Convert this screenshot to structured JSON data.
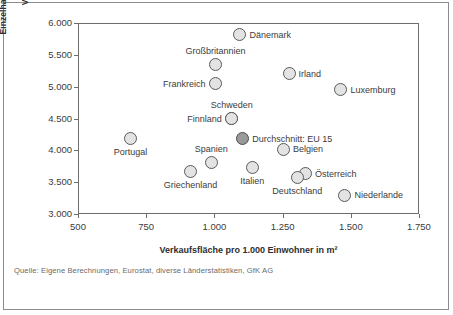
{
  "source_note": "Quelle: Eigene Berechnungen, Eurostat, diverse Länderstatistiken, GfK AG",
  "chart_data": {
    "type": "scatter",
    "title": "",
    "xlabel": "Verkaufsfläche pro 1.000 Einwohner in m²",
    "ylabel_line1": "Einzelhandelsumsatz in Euro pro m²",
    "ylabel_line2": "Verkaufsfläche",
    "xlim": [
      500,
      1750
    ],
    "ylim": [
      3000,
      6000
    ],
    "xticks": [
      "500",
      "750",
      "1.000",
      "1.250",
      "1.500",
      "1.750"
    ],
    "xtick_values": [
      500,
      750,
      1000,
      1250,
      1500,
      1750
    ],
    "yticks": [
      "3.000",
      "3.500",
      "4.000",
      "4.500",
      "5.000",
      "5.500",
      "6.000"
    ],
    "ytick_values": [
      3000,
      3500,
      4000,
      4500,
      5000,
      5500,
      6000
    ],
    "grid": false,
    "legend": "none",
    "marker_fill": "#e3e3e3",
    "marker_edge": "#5a5a5a",
    "highlight_fill": "#9a9a9a",
    "points": [
      {
        "name": "Dänemark",
        "x": 1090,
        "y": 5830,
        "label_pos": "right",
        "highlight": false
      },
      {
        "name": "Großbritannien",
        "x": 1000,
        "y": 5360,
        "label_pos": "above",
        "highlight": false
      },
      {
        "name": "Frankreich",
        "x": 1000,
        "y": 5060,
        "label_pos": "left",
        "highlight": false
      },
      {
        "name": "Irland",
        "x": 1270,
        "y": 5220,
        "label_pos": "right",
        "highlight": false
      },
      {
        "name": "Luxemburg",
        "x": 1460,
        "y": 4970,
        "label_pos": "right",
        "highlight": false
      },
      {
        "name": "Schweden",
        "x": 1060,
        "y": 4510,
        "label_pos": "above",
        "highlight": false
      },
      {
        "name": "Finnland",
        "x": 1060,
        "y": 4510,
        "label_pos": "left",
        "highlight": false
      },
      {
        "name": "Durchschnitt: EU 15",
        "x": 1100,
        "y": 4200,
        "label_pos": "right",
        "highlight": true
      },
      {
        "name": "Portugal",
        "x": 690,
        "y": 4200,
        "label_pos": "below",
        "highlight": false
      },
      {
        "name": "Belgien",
        "x": 1250,
        "y": 4030,
        "label_pos": "right",
        "highlight": false
      },
      {
        "name": "Spanien",
        "x": 985,
        "y": 3830,
        "label_pos": "above",
        "highlight": false
      },
      {
        "name": "Griechenland",
        "x": 910,
        "y": 3680,
        "label_pos": "below",
        "highlight": false
      },
      {
        "name": "Italien",
        "x": 1135,
        "y": 3750,
        "label_pos": "below",
        "highlight": false
      },
      {
        "name": "Österreich",
        "x": 1330,
        "y": 3650,
        "label_pos": "right",
        "highlight": false
      },
      {
        "name": "Deutschland",
        "x": 1300,
        "y": 3590,
        "label_pos": "below",
        "highlight": false
      },
      {
        "name": "Niederlande",
        "x": 1475,
        "y": 3310,
        "label_pos": "right",
        "highlight": false
      }
    ]
  }
}
